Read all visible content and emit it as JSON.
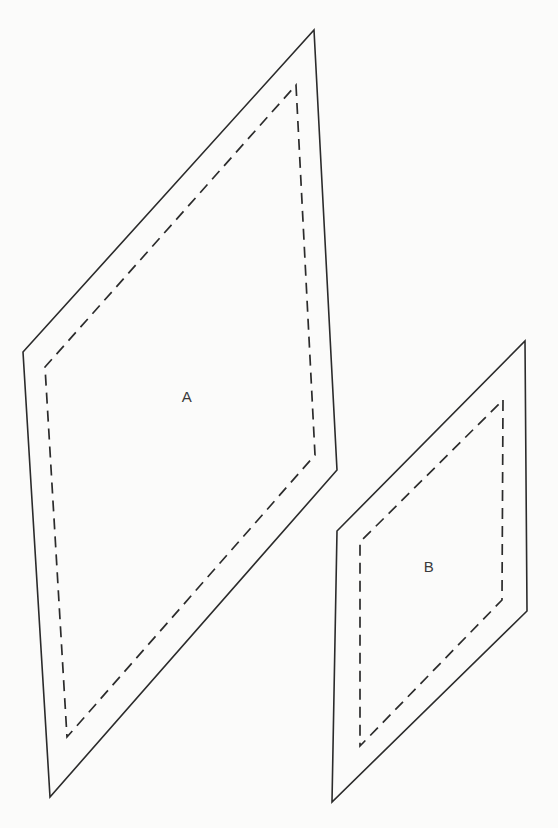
{
  "figure": {
    "background_color": "#fbfbfa",
    "stroke_color": "#2b2b2b",
    "canvas": {
      "width": 558,
      "height": 828
    },
    "shapes": [
      {
        "id": "shape-a",
        "label": "A",
        "label_position": {
          "x": 187,
          "y": 398
        },
        "outline_style": "solid",
        "outline_points": "314,30 337,470 50,797 23,352",
        "inner_style": "dashed",
        "inner_points": "296,85 315,455 67,737 45,367"
      },
      {
        "id": "shape-b",
        "label": "B",
        "label_position": {
          "x": 429,
          "y": 568
        },
        "outline_style": "solid",
        "outline_points": "525,341 527,611 332,802 337,531",
        "inner_style": "dashed",
        "inner_points": "503,400 502,600 360,746 360,542"
      }
    ]
  }
}
